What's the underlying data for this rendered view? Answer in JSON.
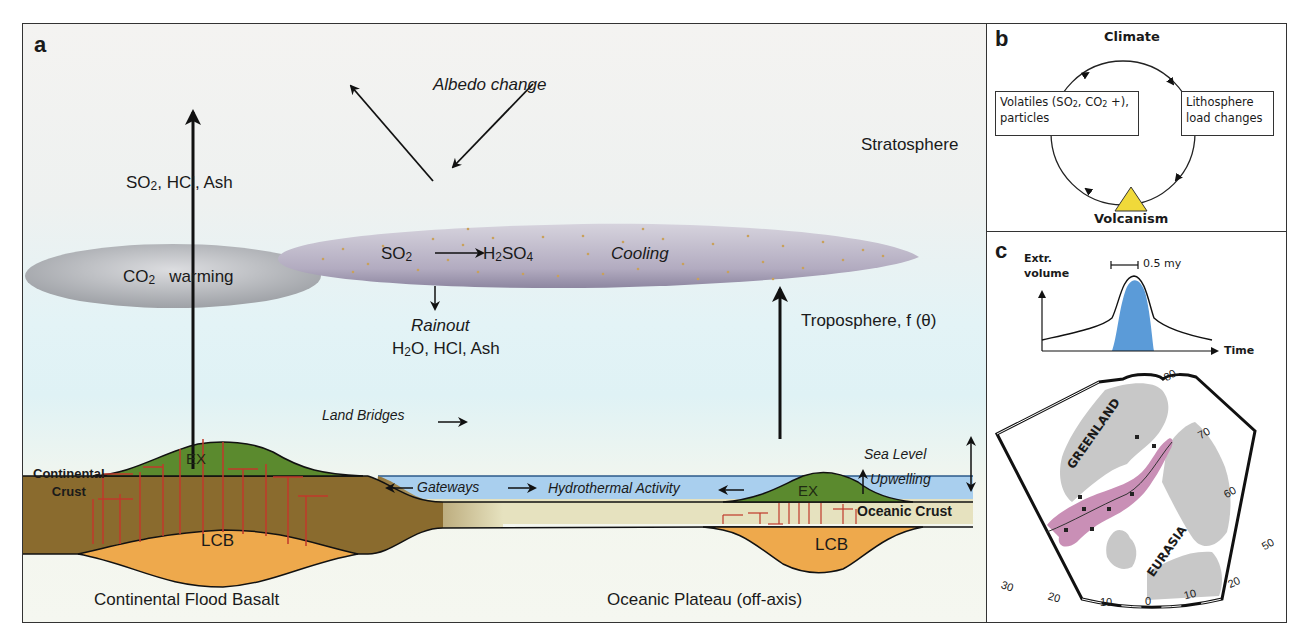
{
  "panel_a": {
    "letter": "a",
    "albedo_change": "Albedo change",
    "stratosphere": "Stratosphere",
    "troposphere": "Troposphere, f (θ)",
    "so2_hcl_ash_label": {
      "so": "SO",
      "rest": ", HCl, Ash",
      "sub": "2"
    },
    "co2_cloud": {
      "co": "CO",
      "sub": "2",
      "warming": "warming"
    },
    "strat_cloud": {
      "so2": "SO",
      "so2_sub": "2",
      "h": "H",
      "h_sub": "2",
      "so4": "SO",
      "so4_sub": "4",
      "cooling": "Cooling"
    },
    "rainout": "Rainout",
    "rainout_species": {
      "h": "H",
      "sub": "2",
      "rest": "O, HCl, Ash"
    },
    "land_bridges": "Land Bridges",
    "gateways": "Gateways",
    "hydrothermal": "Hydrothermal Activity",
    "sea_level": "Sea Level",
    "upwelling": "Upwelling",
    "oceanic_crust": "Oceanic Crust",
    "continental_crust": [
      "Continental",
      "Crust"
    ],
    "ex_left": "EX",
    "ex_right": "EX",
    "lcb_left": "LCB",
    "lcb_right": "LCB",
    "caption_left": "Continental Flood Basalt",
    "caption_right": "Oceanic Plateau (off-axis)",
    "colors": {
      "land_crust": "#8a6b2e",
      "extrusive": "#5b8a2e",
      "lcb": "#eea94c",
      "sea": "#a9cfee",
      "oceanic_crust": "#e6e2bf",
      "dikes": "#c0392b",
      "cloud_co2": "#b9bcc0",
      "cloud_strat": "#a9a1b7",
      "particles": "#c9a15b"
    }
  },
  "panel_b": {
    "letter": "b",
    "climate": "Climate",
    "volcanism": "Volcanism",
    "left_box": {
      "line1_a": "Volatiles (SO",
      "sub1": "2",
      "line1_b": ", CO",
      "sub2": "2",
      "line1_c": " +),",
      "line2": "particles"
    },
    "right_box": {
      "line1": "Lithosphere",
      "line2": "load changes"
    },
    "triangle_color": "#f0d93a"
  },
  "panel_c": {
    "letter": "c",
    "y_label": [
      "Extr.",
      "volume"
    ],
    "x_label": "Time",
    "scale_label": "0.5 my",
    "peak_color": "#5b9bd8",
    "map": {
      "greenland": "GREENLAND",
      "eurasia": "EURASIA",
      "lat_labels": [
        "80",
        "70",
        "60",
        "50"
      ],
      "lon_labels": [
        "30",
        "20",
        "10",
        "0",
        "10",
        "20"
      ],
      "province_color": "#c98fb6",
      "land_color": "#c8c8c8"
    }
  }
}
